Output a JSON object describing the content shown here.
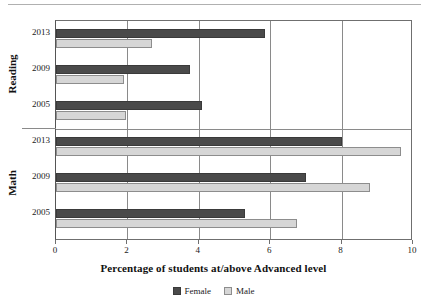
{
  "chart_data": {
    "type": "bar",
    "orientation": "horizontal",
    "title": "",
    "xlabel": "Percentage of students at/above Advanced level",
    "ylabel": "",
    "xlim": [
      0,
      10
    ],
    "xticks": [
      0,
      2,
      4,
      6,
      8,
      10
    ],
    "xtick_labels": [
      "0",
      "2",
      "4",
      "6",
      "8",
      "10"
    ],
    "grid": true,
    "legend_position": "bottom-center",
    "groups": [
      {
        "name": "Reading",
        "categories": [
          "2013",
          "2009",
          "2005"
        ],
        "series": [
          {
            "name": "Female",
            "values": [
              5.85,
              3.75,
              4.1
            ]
          },
          {
            "name": "Male",
            "values": [
              2.7,
              1.9,
              1.95
            ]
          }
        ]
      },
      {
        "name": "Math",
        "categories": [
          "2013",
          "2009",
          "2005"
        ],
        "series": [
          {
            "name": "Female",
            "values": [
              8.0,
              7.0,
              5.3
            ]
          },
          {
            "name": "Male",
            "values": [
              9.65,
              8.8,
              6.75
            ]
          }
        ]
      }
    ],
    "series_colors": {
      "Female": "#4a4a4a",
      "Male": "#d6d6d6"
    },
    "legend": [
      {
        "label": "Female",
        "color": "#4a4a4a"
      },
      {
        "label": "Male",
        "color": "#d6d6d6"
      }
    ]
  },
  "legend": {
    "female_label": "Female",
    "male_label": "Male"
  },
  "axis": {
    "title": "Percentage of students at/above Advanced level",
    "tick_0": "0",
    "tick_2": "2",
    "tick_4": "4",
    "tick_6": "6",
    "tick_8": "8",
    "tick_10": "10"
  },
  "groups": {
    "reading_label": "Reading",
    "math_label": "Math",
    "reading_years": {
      "y2013": "2013",
      "y2009": "2009",
      "y2005": "2005"
    },
    "math_years": {
      "y2013": "2013",
      "y2009": "2009",
      "y2005": "2005"
    }
  }
}
